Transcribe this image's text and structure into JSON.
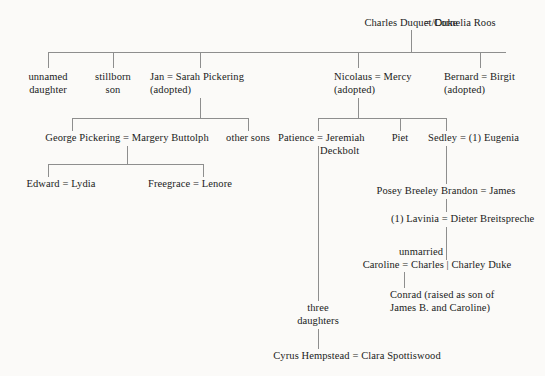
{
  "diagram": {
    "type": "genealogy-chart",
    "background_color": "#fbfaf8",
    "line_color": "#8e8e8e",
    "text_color": "#1a1a1a",
    "marriage_symbol": "=",
    "alias_separator": "|"
  },
  "generations": {
    "g1": {
      "couple": {
        "left": "Charles Duquet/Duke",
        "symbol": "=",
        "right": "Cornelia Roos"
      }
    },
    "g2": {
      "children": [
        {
          "line1": "unnamed",
          "line2": "daughter"
        },
        {
          "line1": "stillborn",
          "line2": "son"
        },
        {
          "line1": "Jan = Sarah Pickering",
          "line2": "(adopted)"
        },
        {
          "line1": "Nicolaus = Mercy",
          "line2": "(adopted)"
        },
        {
          "line1": "Bernard = Birgit",
          "line2": "(adopted)"
        }
      ]
    },
    "g3": {
      "jan_children": [
        {
          "line1": "George Pickering = Margery Buttolph",
          "line2": ""
        },
        {
          "line1": "other sons",
          "line2": ""
        }
      ],
      "nicolaus_children": [
        {
          "line1": "Patience = Jeremiah",
          "line2": "Deckbolt"
        },
        {
          "line1": "Piet",
          "line2": ""
        },
        {
          "line1": "Sedley = (1) Eugenia",
          "line2": ""
        }
      ]
    },
    "g4": {
      "george_children": [
        {
          "line1": "Edward = Lydia",
          "line2": ""
        },
        {
          "line1": "Freegrace = Lenore",
          "line2": ""
        }
      ],
      "sedley_children": [
        {
          "line1": "Posey Breeley Brandon = James",
          "line2": ""
        }
      ]
    },
    "g5": {
      "posey_children": [
        {
          "line1": "(1) Lavinia = Dieter Breitspreche",
          "line2": ""
        }
      ]
    },
    "g6": {
      "lavinia_children": [
        {
          "line1": "unmarried",
          "line2": "Caroline = Charles | Charley Duke"
        }
      ]
    },
    "g7": {
      "caroline_children": [
        {
          "line1": "Conrad (raised as son of",
          "line2": "James B. and Caroline)"
        }
      ]
    },
    "patience_line": {
      "children": [
        {
          "line1": "three",
          "line2": "daughters"
        }
      ],
      "descendants": [
        {
          "line1": "Cyrus Hempstead = Clara Spottiswood",
          "line2": ""
        }
      ]
    }
  },
  "labels": {
    "root_left": "Charles Duquet/Duke",
    "root_right": "Cornelia Roos",
    "unnamed_daughter_l1": "unnamed",
    "unnamed_daughter_l2": "daughter",
    "stillborn_son_l1": "stillborn",
    "stillborn_son_l2": "son",
    "jan_l1": "Jan = Sarah Pickering",
    "jan_l2": "(adopted)",
    "nicolaus_l1": "Nicolaus = Mercy",
    "nicolaus_l2": "(adopted)",
    "bernard_l1": "Bernard = Birgit",
    "bernard_l2": "(adopted)",
    "george_l1": "George Pickering = Margery Buttolph",
    "other_sons": "other sons",
    "patience_l1": "Patience = Jeremiah",
    "patience_l2": "Deckbolt",
    "piet": "Piet",
    "sedley": "Sedley = (1) Eugenia",
    "edward": "Edward = Lydia",
    "freegrace": "Freegrace = Lenore",
    "posey": "Posey Breeley Brandon = James",
    "lavinia": "(1) Lavinia = Dieter Breitspreche",
    "unmarried": "unmarried",
    "caroline": "Caroline = Charles | Charley Duke",
    "conrad_l1": "Conrad (raised as son of",
    "conrad_l2": "James B. and Caroline)",
    "three_l1": "three",
    "three_l2": "daughters",
    "cyrus": "Cyrus Hempstead = Clara Spottiswood"
  }
}
